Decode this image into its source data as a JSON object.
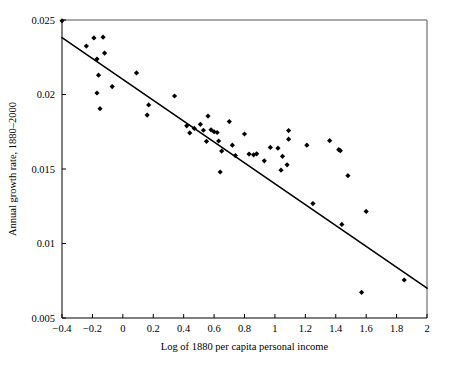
{
  "figure": {
    "title": "",
    "background_color": "#ffffff",
    "ink_color": "#000000",
    "frame_color": "#555555"
  },
  "chart_data": {
    "type": "scatter",
    "title": "",
    "subtitle": "",
    "xlabel": "Log of 1880 per capita personal income",
    "ylabel": "Annual growth rate, 1880–2000",
    "xlim": [
      -0.4,
      2.0
    ],
    "ylim": [
      0.005,
      0.025
    ],
    "xticks": [
      -0.4,
      -0.2,
      0,
      0.2,
      0.4,
      0.6,
      0.8,
      1.0,
      1.2,
      1.4,
      1.6,
      1.8,
      2.0
    ],
    "xticklabels": [
      "−0.4",
      "−0.2",
      "0",
      "0.2",
      "0.4",
      "0.6",
      "0.8",
      "1",
      "1.2",
      "1.4",
      "1.6",
      "1.8",
      "2"
    ],
    "yticks": [
      0.005,
      0.01,
      0.015,
      0.02,
      0.025
    ],
    "yticklabels": [
      "0.005",
      "0.01",
      "0.015",
      "0.02",
      "0.025"
    ],
    "grid": false,
    "legend": null,
    "legend_position": "none",
    "marker": "diamond",
    "marker_color": "#000000",
    "series": [
      {
        "name": "states",
        "points": [
          [
            -0.4,
            0.02495
          ],
          [
            -0.24,
            0.02325
          ],
          [
            -0.19,
            0.0238
          ],
          [
            -0.17,
            0.02238
          ],
          [
            -0.17,
            0.0201
          ],
          [
            -0.16,
            0.0213
          ],
          [
            -0.15,
            0.01905
          ],
          [
            -0.13,
            0.02385
          ],
          [
            -0.12,
            0.02278
          ],
          [
            -0.07,
            0.02053
          ],
          [
            0.09,
            0.02145
          ],
          [
            0.17,
            0.0193
          ],
          [
            0.16,
            0.01862
          ],
          [
            0.34,
            0.0199
          ],
          [
            0.42,
            0.0179
          ],
          [
            0.44,
            0.01742
          ],
          [
            0.47,
            0.01772
          ],
          [
            0.51,
            0.018
          ],
          [
            0.53,
            0.0176
          ],
          [
            0.55,
            0.01686
          ],
          [
            0.56,
            0.01855
          ],
          [
            0.58,
            0.01763
          ],
          [
            0.6,
            0.0175
          ],
          [
            0.62,
            0.01745
          ],
          [
            0.63,
            0.01688
          ],
          [
            0.64,
            0.0148
          ],
          [
            0.65,
            0.0162
          ],
          [
            0.7,
            0.01818
          ],
          [
            0.72,
            0.0166
          ],
          [
            0.74,
            0.0159
          ],
          [
            0.8,
            0.01735
          ],
          [
            0.83,
            0.016
          ],
          [
            0.86,
            0.01595
          ],
          [
            0.88,
            0.01602
          ],
          [
            0.93,
            0.01555
          ],
          [
            0.97,
            0.01645
          ],
          [
            1.02,
            0.0164
          ],
          [
            1.04,
            0.01492
          ],
          [
            1.05,
            0.01585
          ],
          [
            1.08,
            0.01528
          ],
          [
            1.09,
            0.01758
          ],
          [
            1.09,
            0.017
          ],
          [
            1.21,
            0.0166
          ],
          [
            1.25,
            0.01268
          ],
          [
            1.36,
            0.0169
          ],
          [
            1.42,
            0.0163
          ],
          [
            1.43,
            0.01623
          ],
          [
            1.44,
            0.01128
          ],
          [
            1.48,
            0.01455
          ],
          [
            1.57,
            0.00672
          ],
          [
            1.6,
            0.01215
          ],
          [
            1.85,
            0.00755
          ]
        ]
      }
    ],
    "trendline": {
      "name": "ols-fit",
      "x": [
        -0.4,
        2.0
      ],
      "y": [
        0.02382,
        0.007
      ],
      "color": "#000000"
    }
  }
}
